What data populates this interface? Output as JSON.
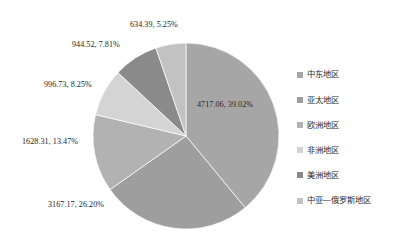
{
  "chart_data": {
    "type": "pie",
    "title": "",
    "categories": [
      "中东地区",
      "亚太地区",
      "欧洲地区",
      "非洲地区",
      "美洲地区",
      "中亚—俄罗斯地区"
    ],
    "values": [
      4717.06,
      3167.17,
      1628.31,
      996.73,
      944.52,
      634.39
    ],
    "percents": [
      39.02,
      26.2,
      13.47,
      8.25,
      7.81,
      5.25
    ],
    "data_labels": [
      "4717.06, 39.02%",
      "3167.17, 26.20%",
      "1628.31, 13.47%",
      "996.73, 8.25%",
      "944.52, 7.81%",
      "634.39, 5.25%"
    ],
    "colors": [
      "#a6a6a6",
      "#9e9e9e",
      "#b2b2b2",
      "#d4d4d4",
      "#8a8a8a",
      "#c2c2c2"
    ],
    "legend_position": "right",
    "start_angle": 0,
    "direction": "clockwise",
    "grid": false,
    "xlabel": "",
    "ylabel": ""
  },
  "legend": {
    "items": [
      {
        "label": "中东地区",
        "color": "#a6a6a6"
      },
      {
        "label": "亚太地区",
        "color": "#9e9e9e"
      },
      {
        "label": "欧洲地区",
        "color": "#b2b2b2"
      },
      {
        "label": "非洲地区",
        "color": "#d4d4d4"
      },
      {
        "label": "美洲地区",
        "color": "#8a8a8a"
      },
      {
        "label": "中亚—俄罗斯地区",
        "color": "#c2c2c2"
      }
    ]
  },
  "labels": {
    "top": "634.39, 5.25%",
    "upper_left": "944.52, 7.81%",
    "left_upper": "996.73, 8.25%",
    "left": "1628.31, 13.47%",
    "bottom_left": "3167.17, 26.20%",
    "inside_right": "4717.06, 39.02%"
  }
}
